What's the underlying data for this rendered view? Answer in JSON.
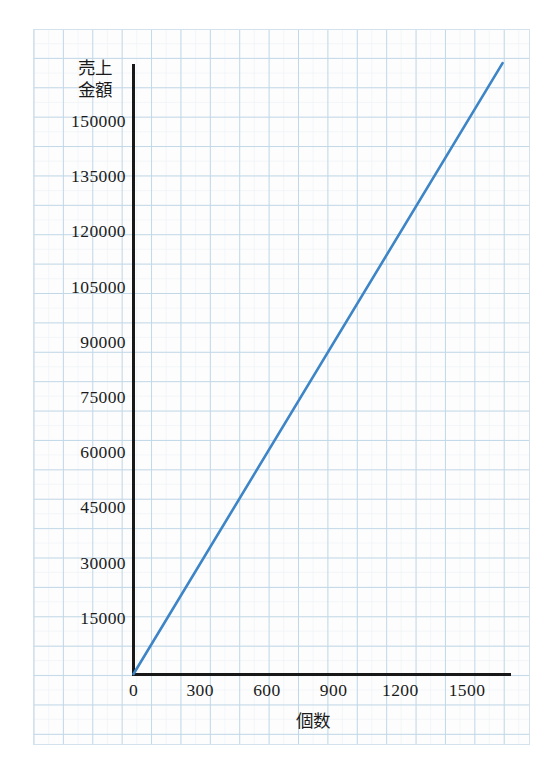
{
  "chart_data": {
    "type": "line",
    "title": "",
    "xlabel": "個数",
    "ylabel": "売上金額",
    "ylabel_lines": [
      "売上",
      "金額"
    ],
    "xlim": [
      0,
      1700
    ],
    "ylim": [
      0,
      160000
    ],
    "xticks": [
      0,
      300,
      600,
      900,
      1200,
      1500
    ],
    "xtick_labels": [
      "0",
      "300",
      "600",
      "900",
      "1200",
      "1500"
    ],
    "yticks": [
      15000,
      30000,
      45000,
      60000,
      75000,
      90000,
      105000,
      120000,
      135000,
      150000
    ],
    "ytick_labels": [
      "15000",
      "30000",
      "45000",
      "60000",
      "75000",
      "90000",
      "105000",
      "120000",
      "135000",
      "150000"
    ],
    "grid": true,
    "grid_color": "#c3d9e8",
    "legend": "none",
    "series": [
      {
        "name": "売上金額",
        "color": "#3d85c6",
        "x": [
          0,
          1660
        ],
        "values": [
          0,
          166000
        ],
        "slope_per_unit": 100
      }
    ]
  },
  "axes": {
    "axis_color": "#181818"
  }
}
